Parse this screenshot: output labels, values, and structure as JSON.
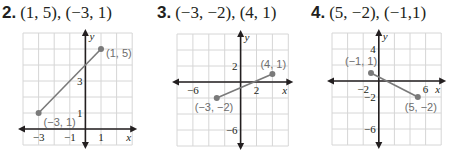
{
  "problems": [
    {
      "number": "2.",
      "points_text": "(1, 5), (−3, 1)",
      "graph": {
        "grid": {
          "left": 23,
          "top": 33,
          "cols": 7,
          "rows": 7,
          "cell_w": 15.6,
          "cell_h": 16
        },
        "origin": {
          "col": 4,
          "row": 6
        },
        "unit_per_cell": 1,
        "x_tick_labels": [
          {
            "value": -3,
            "text": "−3"
          },
          {
            "value": -1,
            "text": "−1"
          },
          {
            "value": 1,
            "text": "1"
          }
        ],
        "y_tick_labels": [
          {
            "value": 3,
            "text": "3"
          },
          {
            "value": 1,
            "text": "1"
          }
        ],
        "x_axis_label": "x",
        "y_axis_label": "y",
        "points": [
          {
            "x": 1,
            "y": 5,
            "label": "(1, 5)",
            "label_dx": 5,
            "label_dy": 8
          },
          {
            "x": -3,
            "y": 1,
            "label": "(−3, 1)",
            "label_dx": 5,
            "label_dy": 13
          }
        ]
      }
    },
    {
      "number": "3.",
      "points_text": "(−3, −2), (4, 1)",
      "graph": {
        "grid": {
          "left": 177,
          "top": 34,
          "cols": 7,
          "rows": 7,
          "cell_w": 15.9,
          "cell_h": 16
        },
        "origin": {
          "col": 4,
          "row": 3
        },
        "unit_per_cell": 2,
        "x_tick_labels": [
          {
            "value": -6,
            "text": "−6"
          },
          {
            "value": 2,
            "text": "2"
          }
        ],
        "y_tick_labels": [
          {
            "value": 2,
            "text": "2"
          },
          {
            "value": -6,
            "text": "−6"
          }
        ],
        "x_axis_label": "x",
        "y_axis_label": "y",
        "points": [
          {
            "x": 4,
            "y": 1,
            "label": "(4, 1)",
            "label_dx": -12,
            "label_dy": -6
          },
          {
            "x": -3,
            "y": -2,
            "label": "(−3, −2)",
            "label_dx": -22,
            "label_dy": 13
          }
        ]
      }
    },
    {
      "number": "4.",
      "points_text": "(5, −2), (−1,1)",
      "graph": {
        "grid": {
          "left": 332,
          "top": 33,
          "cols": 7,
          "rows": 7,
          "cell_w": 15.6,
          "cell_h": 16
        },
        "origin": {
          "col": 3,
          "row": 3
        },
        "unit_per_cell": 2,
        "x_tick_labels": [
          {
            "value": -2,
            "text": "−2"
          },
          {
            "value": 6,
            "text": "6"
          }
        ],
        "y_tick_labels": [
          {
            "value": 4,
            "text": "4"
          },
          {
            "value": -2,
            "text": "−2"
          },
          {
            "value": -6,
            "text": "−6"
          }
        ],
        "x_axis_label": "x",
        "y_axis_label": "y",
        "points": [
          {
            "x": -1,
            "y": 1,
            "label": "(−1, 1)",
            "label_dx": -26,
            "label_dy": -8
          },
          {
            "x": 5,
            "y": -2,
            "label": "(5, −2)",
            "label_dx": -13,
            "label_dy": 14
          }
        ]
      }
    }
  ],
  "chart_data": [
    {
      "type": "line",
      "title": "2. (1, 5), (−3, 1)",
      "xlabel": "x",
      "ylabel": "y",
      "xlim": [
        -4,
        3
      ],
      "ylim": [
        -1,
        6
      ],
      "grid": true,
      "x_ticks": [
        -3,
        -1,
        1
      ],
      "y_ticks": [
        1,
        3
      ],
      "series": [
        {
          "name": "segment",
          "x": [
            -3,
            1
          ],
          "y": [
            1,
            5
          ]
        }
      ],
      "annotations": [
        "(1, 5)",
        "(−3, 1)"
      ]
    },
    {
      "type": "line",
      "title": "3. (−3, −2), (4, 1)",
      "xlabel": "x",
      "ylabel": "y",
      "xlim": [
        -8,
        6
      ],
      "ylim": [
        -8,
        6
      ],
      "grid": true,
      "x_ticks": [
        -6,
        2
      ],
      "y_ticks": [
        2,
        -6
      ],
      "series": [
        {
          "name": "segment",
          "x": [
            -3,
            4
          ],
          "y": [
            -2,
            1
          ]
        }
      ],
      "annotations": [
        "(4, 1)",
        "(−3, −2)"
      ]
    },
    {
      "type": "line",
      "title": "4. (5, −2), (−1,1)",
      "xlabel": "x",
      "ylabel": "y",
      "xlim": [
        -6,
        8
      ],
      "ylim": [
        -8,
        6
      ],
      "grid": true,
      "x_ticks": [
        -2,
        6
      ],
      "y_ticks": [
        4,
        -2,
        -6
      ],
      "series": [
        {
          "name": "segment",
          "x": [
            -1,
            5
          ],
          "y": [
            1,
            -2
          ]
        }
      ],
      "annotations": [
        "(−1, 1)",
        "(5, −2)"
      ]
    }
  ]
}
